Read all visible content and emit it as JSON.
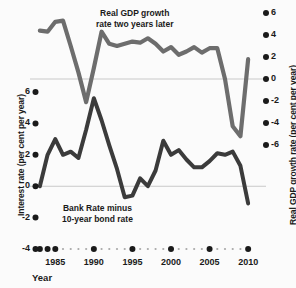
{
  "chart_data": {
    "type": "line",
    "title": "",
    "xlabel": "Year",
    "grid": "zero-lines-only",
    "legend_position": "inline-annotations",
    "xlim": [
      1982.5,
      2010.5
    ],
    "x_ticks_major": [
      1985,
      1990,
      1995,
      2000,
      2005,
      2010
    ],
    "x_tick_labels": [
      "1985",
      "1990",
      "1995",
      "2000",
      "2005",
      "2010"
    ],
    "axes": [
      {
        "id": "left",
        "label": "Interest rate (per cent per year)",
        "ylim": [
          -4,
          6
        ],
        "ticks": [
          6,
          4,
          2,
          0,
          -2,
          -4
        ],
        "tick_labels": [
          "6",
          "4",
          "2",
          "0",
          "-2",
          "-4"
        ]
      },
      {
        "id": "right",
        "label": "Real GDP growth rate (per cent per year)",
        "ylim": [
          -6,
          6
        ],
        "ticks": [
          6,
          4,
          2,
          0,
          -2,
          -4,
          -6
        ],
        "tick_labels": [
          "6",
          "4",
          "2",
          "0",
          "-2",
          "-4",
          "-6"
        ]
      }
    ],
    "series": [
      {
        "name": "Real GDP growth rate two years later",
        "axis": "right",
        "color": "#6d6d6d",
        "annotation": "Real GDP growth\nrate two years later",
        "x": [
          1983,
          1984,
          1985,
          1986,
          1987,
          1988,
          1989,
          1990,
          1991,
          1992,
          1993,
          1994,
          1995,
          1996,
          1997,
          1998,
          1999,
          2000,
          2001,
          2002,
          2003,
          2004,
          2005,
          2006,
          2007,
          2008,
          2009,
          2010
        ],
        "values": [
          4.4,
          4.3,
          5.2,
          5.3,
          3.0,
          0.6,
          -2.1,
          1.0,
          4.3,
          3.2,
          3.0,
          3.2,
          3.4,
          3.3,
          3.7,
          3.2,
          2.5,
          2.9,
          2.2,
          2.5,
          2.9,
          2.4,
          2.8,
          2.8,
          0.0,
          -4.3,
          -5.2,
          1.8
        ]
      },
      {
        "name": "Bank Rate minus 10-year bond rate",
        "axis": "left",
        "color": "#3b3b3b",
        "annotation": "Bank Rate minus\n10-year bond rate",
        "x": [
          1983,
          1984,
          1985,
          1986,
          1987,
          1988,
          1989,
          1990,
          1991,
          1992,
          1993,
          1994,
          1995,
          1996,
          1997,
          1998,
          1999,
          2000,
          2001,
          2002,
          2003,
          2004,
          2005,
          2006,
          2007,
          2008,
          2009,
          2010
        ],
        "values": [
          0.0,
          2.0,
          3.0,
          2.0,
          2.2,
          1.8,
          3.6,
          5.6,
          4.2,
          2.6,
          1.1,
          -0.7,
          -0.6,
          0.5,
          0.0,
          1.0,
          2.9,
          2.0,
          2.3,
          1.7,
          1.2,
          1.2,
          1.6,
          2.1,
          2.0,
          2.2,
          1.3,
          -1.1
        ]
      }
    ]
  },
  "axis_titles": {
    "left": "Interest rate (per cent per year)",
    "right": "Real GDP growth rate (per cent per year)",
    "x": "Year"
  },
  "annotations": {
    "gdp_line1": "Real GDP growth",
    "gdp_line2": "rate two years later",
    "bank_line1": "Bank Rate minus",
    "bank_line2": "10-year bond rate"
  },
  "colors": {
    "gdp_series": "#6d6d6d",
    "bank_series": "#3b3b3b",
    "gridline": "#c9c9c9",
    "text": "#1a1a1a",
    "background": "#fbfbfb"
  }
}
